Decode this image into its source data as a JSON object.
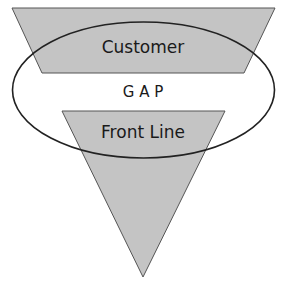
{
  "diagram": {
    "top_shape": {
      "label": "Customer",
      "fill": "#c4c4c4",
      "stroke": "#555555"
    },
    "middle_ellipse": {
      "label": "G A P",
      "stroke": "#222222"
    },
    "bottom_shape": {
      "label": "Front Line",
      "fill": "#c4c4c4",
      "stroke": "#555555"
    }
  }
}
